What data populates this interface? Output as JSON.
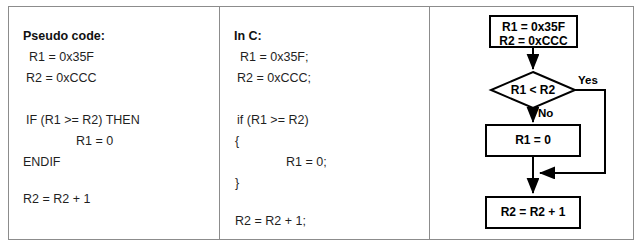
{
  "columns": {
    "pseudo": {
      "title": "Pseudo code:",
      "lines": [
        "R1 = 0x35F",
        "R2 = 0xCCC",
        "IF (R1 >= R2) THEN",
        "R1 = 0",
        "ENDIF",
        "R2 = R2 + 1"
      ]
    },
    "c": {
      "title": "In C:",
      "lines": [
        "R1 = 0x35F;",
        "R2 = 0xCCC;",
        "if (R1 >= R2)",
        "{",
        "R1 = 0;",
        "}",
        "R2 = R2 + 1;"
      ]
    }
  },
  "flowchart": {
    "type": "flowchart",
    "nodes": [
      {
        "id": "init",
        "shape": "process",
        "lines": [
          "R1 = 0x35F",
          "R2 = 0xCCC"
        ]
      },
      {
        "id": "decision",
        "shape": "decision",
        "lines": [
          "R1 < R2"
        ]
      },
      {
        "id": "assign",
        "shape": "process",
        "lines": [
          "R1 = 0"
        ]
      },
      {
        "id": "increment",
        "shape": "process",
        "lines": [
          "R2 = R2 + 1"
        ]
      }
    ],
    "edge_labels": {
      "yes": "Yes",
      "no": "No"
    }
  },
  "colors": {
    "frame_border": "#8c8c8c",
    "shape_stroke": "#000000",
    "background": "#ffffff",
    "text": "#1f1f1f"
  }
}
